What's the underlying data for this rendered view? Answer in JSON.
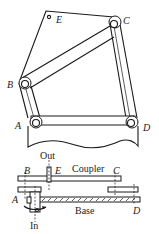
{
  "figure": {
    "top_view": {
      "labels": {
        "A": "A",
        "B": "B",
        "C": "C",
        "D": "D",
        "E": "E"
      }
    },
    "side_view": {
      "labels": {
        "out": "Out",
        "in": "In",
        "coupler": "Coupler",
        "base": "Base",
        "A": "A",
        "B": "B",
        "C": "C",
        "D": "D",
        "E": "E"
      }
    }
  }
}
